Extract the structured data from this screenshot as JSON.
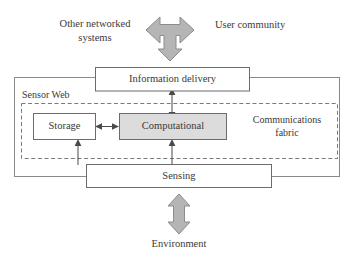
{
  "diagram": {
    "colors": {
      "box_border": "#6b6b6b",
      "box_fill_white": "#ffffff",
      "box_fill_gray": "#dcdcdc",
      "outer_boundary": "#8a8a8a",
      "dashed_boundary": "#7a7a7a",
      "connector": "#4a4a4a",
      "block_arrow_fill": "#b5b5b5",
      "block_arrow_stroke": "#8c8c8c",
      "text": "#3a3a3a",
      "background": "#ffffff"
    },
    "external_labels": {
      "other_networked_line1": "Other networked",
      "other_networked_line2": "systems",
      "user_community": "User community",
      "environment": "Environment"
    },
    "boundaries": {
      "sensor_web_label": "Sensor Web",
      "communications_fabric_line1": "Communications",
      "communications_fabric_line2": "fabric"
    },
    "boxes": [
      {
        "id": "information-delivery",
        "label": "Information delivery",
        "fill": "white"
      },
      {
        "id": "storage",
        "label": "Storage",
        "fill": "white"
      },
      {
        "id": "computational",
        "label": "Computational",
        "fill": "gray"
      },
      {
        "id": "sensing",
        "label": "Sensing",
        "fill": "white"
      }
    ],
    "block_arrows": [
      {
        "id": "three-way-arrow",
        "name": "three-way-block-arrow",
        "directions": "left-right-down"
      },
      {
        "id": "environment-arrow",
        "name": "environment-block-arrow",
        "directions": "up-down"
      }
    ],
    "connectors": [
      {
        "id": "delivery-to-computational",
        "name": "bidirectional-arrow",
        "from": "information-delivery",
        "to": "computational"
      },
      {
        "id": "storage-to-computational",
        "name": "bidirectional-arrow",
        "from": "storage",
        "to": "computational"
      },
      {
        "id": "sensing-to-storage",
        "name": "upward-arrow",
        "from": "sensing",
        "to": "storage"
      },
      {
        "id": "sensing-to-computational",
        "name": "upward-arrow",
        "from": "sensing",
        "to": "computational"
      }
    ]
  }
}
